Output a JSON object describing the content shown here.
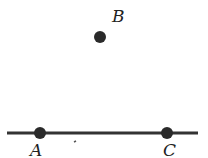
{
  "diagram": {
    "line": {
      "x1": 7,
      "y1": 133,
      "x2": 198,
      "y2": 133,
      "color": "#333333"
    },
    "points": [
      {
        "name": "A",
        "x": 40,
        "y": 133,
        "label_x": 30,
        "label_y": 156
      },
      {
        "name": "B",
        "x": 100,
        "y": 37,
        "label_x": 112,
        "label_y": 22
      },
      {
        "name": "C",
        "x": 167,
        "y": 133,
        "label_x": 163,
        "label_y": 156
      }
    ],
    "point_color": "#2a2a2a"
  }
}
